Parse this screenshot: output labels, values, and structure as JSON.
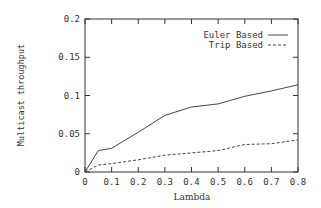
{
  "chart_data": {
    "type": "line",
    "title": "",
    "xlabel": "Lambda",
    "ylabel": "Multicast throughput",
    "xlim": [
      0,
      0.8
    ],
    "ylim": [
      0,
      0.2
    ],
    "grid": false,
    "legend_position": "top-right",
    "x_ticks": [
      "0",
      "0.1",
      "0.2",
      "0.3",
      "0.4",
      "0.5",
      "0.6",
      "0.7",
      "0.8"
    ],
    "y_ticks": [
      "0",
      "0.05",
      "0.1",
      "0.15",
      "0.2"
    ],
    "x": [
      0,
      0.05,
      0.1,
      0.2,
      0.3,
      0.4,
      0.5,
      0.6,
      0.7,
      0.8
    ],
    "series": [
      {
        "name": "Euler Based",
        "style": "solid",
        "values": [
          0,
          0.028,
          0.031,
          0.052,
          0.074,
          0.085,
          0.089,
          0.099,
          0.106,
          0.114
        ]
      },
      {
        "name": "Trip Based",
        "style": "dashed",
        "values": [
          0,
          0.009,
          0.011,
          0.016,
          0.022,
          0.025,
          0.028,
          0.036,
          0.037,
          0.042
        ]
      }
    ]
  },
  "colors": {
    "axis": "#333333",
    "line": "#444444",
    "background": "#ffffff"
  }
}
